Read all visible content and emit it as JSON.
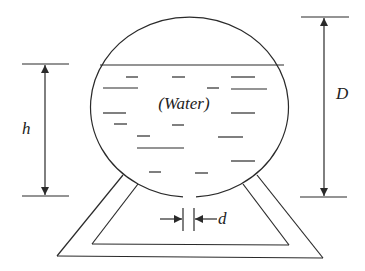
{
  "diagram": {
    "labels": {
      "water": "(Water)",
      "height": "h",
      "diameter": "D",
      "hole_diameter": "d"
    },
    "colors": {
      "line": "#2a2a2a",
      "text": "#222222",
      "background": "#ffffff"
    },
    "tank": {
      "cx": 191,
      "cy": 107,
      "rx": 99,
      "ry": 90,
      "gap_x1": 183,
      "gap_x2": 196
    },
    "water_surface": {
      "x1": 100,
      "x2": 284,
      "y": 65
    },
    "dashes": [
      [
        126,
        138,
        77
      ],
      [
        172,
        185,
        77
      ],
      [
        231,
        255,
        77
      ],
      [
        103,
        138,
        88
      ],
      [
        207,
        219,
        88
      ],
      [
        231,
        267,
        89
      ],
      [
        103,
        126,
        113
      ],
      [
        231,
        255,
        113
      ],
      [
        114,
        127,
        124
      ],
      [
        172,
        184,
        125
      ],
      [
        137,
        150,
        136
      ],
      [
        218,
        243,
        137
      ],
      [
        137,
        184,
        148
      ],
      [
        231,
        255,
        161
      ],
      [
        149,
        161,
        172
      ],
      [
        195,
        208,
        173
      ]
    ],
    "dimension_h": {
      "x": 45,
      "top_y": 64,
      "bottom_y": 196,
      "tick_x1": 22,
      "tick_x2": 69
    },
    "dimension_D": {
      "x": 324,
      "top_y": 17,
      "bottom_y": 197,
      "tick_x1": 301,
      "tick_x2": 349
    },
    "dimension_d": {
      "left_x": 183,
      "right_x": 194,
      "y1": 208,
      "y2": 231,
      "arrow_y": 219
    }
  }
}
